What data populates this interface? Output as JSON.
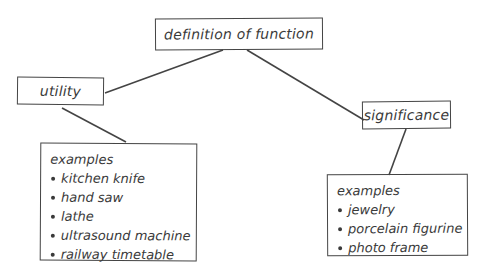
{
  "diagram": {
    "root": {
      "label": "definition of function"
    },
    "branches": [
      {
        "label": "utility",
        "examples_heading": "examples",
        "examples": [
          "kitchen knife",
          "hand saw",
          "lathe",
          "ultrasound machine",
          "railway timetable"
        ]
      },
      {
        "label": "significance",
        "examples_heading": "examples",
        "examples": [
          "jewelry",
          "porcelain figurine",
          "photo frame"
        ]
      }
    ],
    "edges": [
      {
        "from": "definition of function",
        "to": "utility"
      },
      {
        "from": "definition of function",
        "to": "significance"
      },
      {
        "from": "utility",
        "to": "utility examples"
      },
      {
        "from": "significance",
        "to": "significance examples"
      }
    ],
    "colors": {
      "stroke": "#444444",
      "text": "#3a3a3a",
      "background": "#ffffff"
    }
  }
}
